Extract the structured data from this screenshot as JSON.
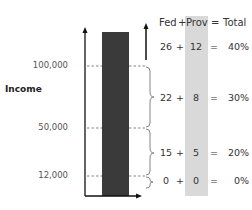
{
  "diagram": {
    "y_axis_title": "Income",
    "tick_labels": [
      {
        "label": "100,000",
        "y": 66
      },
      {
        "label": "50,000",
        "y": 128
      },
      {
        "label": "12,000",
        "y": 176
      }
    ],
    "header": {
      "fed": "Fed",
      "plus": "+",
      "prov": "Prov",
      "equals": "=",
      "total": "Total"
    },
    "rows": [
      {
        "fed": "26",
        "plus": "+",
        "prov": "12",
        "equals": "=",
        "total": "40%"
      },
      {
        "fed": "22",
        "plus": "+",
        "prov": "8",
        "equals": "=",
        "total": "30%"
      },
      {
        "fed": "15",
        "plus": "+",
        "prov": "5",
        "equals": "=",
        "total": "20%"
      },
      {
        "fed": "0",
        "plus": "+",
        "prov": "0",
        "equals": "=",
        "total": "0%"
      }
    ],
    "colors": {
      "bar": "#3a3a3a",
      "prov_column": "#d9d9d9",
      "axis": "#111111",
      "dash": "#666666"
    }
  }
}
